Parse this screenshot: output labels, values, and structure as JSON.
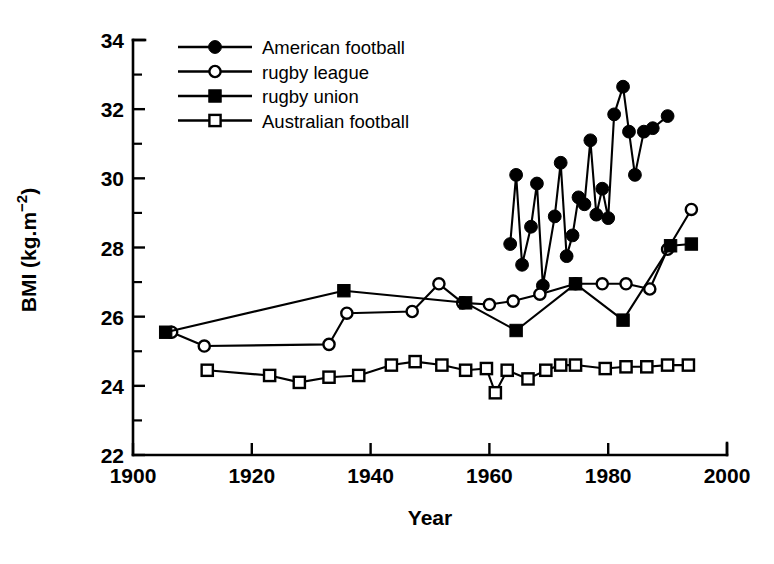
{
  "chart_data": {
    "type": "line",
    "title": "",
    "subtitle": "",
    "xlabel": "Year",
    "ylabel": "BMI (kg.m−2)",
    "ylabel_parts": {
      "base": "BMI (kg.m",
      "sup": "−2",
      "tail": ")"
    },
    "xlim": [
      1900,
      2000
    ],
    "ylim": [
      22,
      34
    ],
    "x_ticks": [
      1900,
      1920,
      1940,
      1960,
      1980,
      2000
    ],
    "x_tick_labels": [
      "1900",
      "1920",
      "1940",
      "1960",
      "1980",
      "2000"
    ],
    "y_ticks": [
      22,
      24,
      26,
      28,
      30,
      32,
      34
    ],
    "y_tick_labels": [
      "22",
      "24",
      "26",
      "28",
      "30",
      "32",
      "34"
    ],
    "y_minor_ticks": [
      23,
      25,
      27,
      29,
      31,
      33
    ],
    "grid": false,
    "legend_position": "top-left-inside",
    "series": [
      {
        "name": "American football",
        "marker": "filled-circle",
        "color": "#000000",
        "points": [
          [
            1963.5,
            28.1
          ],
          [
            1964.5,
            30.1
          ],
          [
            1965.5,
            27.5
          ],
          [
            1967.0,
            28.6
          ],
          [
            1968.0,
            29.85
          ],
          [
            1969.0,
            26.9
          ],
          [
            1971.0,
            28.9
          ],
          [
            1972.0,
            30.45
          ],
          [
            1973.0,
            27.75
          ],
          [
            1974.0,
            28.35
          ],
          [
            1975.0,
            29.45
          ],
          [
            1976.0,
            29.25
          ],
          [
            1977.0,
            31.1
          ],
          [
            1978.0,
            28.95
          ],
          [
            1979.0,
            29.7
          ],
          [
            1980.0,
            28.85
          ],
          [
            1981.0,
            31.85
          ],
          [
            1982.5,
            32.65
          ],
          [
            1983.5,
            31.35
          ],
          [
            1984.5,
            30.1
          ],
          [
            1986.0,
            31.35
          ],
          [
            1987.5,
            31.45
          ],
          [
            1990.0,
            31.8
          ]
        ]
      },
      {
        "name": "rugby league",
        "marker": "open-circle",
        "color": "#000000",
        "points": [
          [
            1906.5,
            25.55
          ],
          [
            1912.0,
            25.15
          ],
          [
            1933.0,
            25.2
          ],
          [
            1936.0,
            26.1
          ],
          [
            1947.0,
            26.15
          ],
          [
            1951.5,
            26.95
          ],
          [
            1955.5,
            26.4
          ],
          [
            1960.0,
            26.35
          ],
          [
            1964.0,
            26.45
          ],
          [
            1968.5,
            26.65
          ],
          [
            1974.5,
            26.95
          ],
          [
            1979.0,
            26.95
          ],
          [
            1983.0,
            26.95
          ],
          [
            1987.0,
            26.8
          ],
          [
            1990.0,
            27.95
          ],
          [
            1994.0,
            29.1
          ]
        ]
      },
      {
        "name": "rugby union",
        "marker": "filled-square",
        "color": "#000000",
        "points": [
          [
            1905.5,
            25.55
          ],
          [
            1935.5,
            26.75
          ],
          [
            1956.0,
            26.4
          ],
          [
            1964.5,
            25.6
          ],
          [
            1974.5,
            26.95
          ],
          [
            1982.5,
            25.9
          ],
          [
            1990.5,
            28.05
          ],
          [
            1994.0,
            28.1
          ]
        ]
      },
      {
        "name": "Australian football",
        "marker": "open-square",
        "color": "#000000",
        "points": [
          [
            1912.5,
            24.45
          ],
          [
            1923.0,
            24.3
          ],
          [
            1928.0,
            24.1
          ],
          [
            1933.0,
            24.25
          ],
          [
            1938.0,
            24.3
          ],
          [
            1943.5,
            24.6
          ],
          [
            1947.5,
            24.7
          ],
          [
            1952.0,
            24.6
          ],
          [
            1956.0,
            24.45
          ],
          [
            1959.5,
            24.5
          ],
          [
            1961.0,
            23.8
          ],
          [
            1963.0,
            24.45
          ],
          [
            1966.5,
            24.2
          ],
          [
            1969.5,
            24.45
          ],
          [
            1972.0,
            24.6
          ],
          [
            1974.5,
            24.6
          ],
          [
            1979.5,
            24.5
          ],
          [
            1983.0,
            24.55
          ],
          [
            1986.5,
            24.55
          ],
          [
            1990.0,
            24.6
          ],
          [
            1993.5,
            24.6
          ]
        ]
      }
    ]
  },
  "legend": {
    "entries": [
      {
        "label": "American football",
        "marker": "filled-circle"
      },
      {
        "label": "rugby league",
        "marker": "open-circle"
      },
      {
        "label": "rugby union",
        "marker": "filled-square"
      },
      {
        "label": "Australian football",
        "marker": "open-square"
      }
    ]
  }
}
